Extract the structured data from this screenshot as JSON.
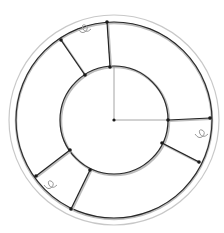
{
  "diagram": {
    "type": "circular-track-layout",
    "center": {
      "x": 114,
      "y": 120
    },
    "colors": {
      "background": "#ffffff",
      "outer_circle": "#c8c8c8",
      "track": "#2a2a2a",
      "track_shadow": "#bdbdbd",
      "spoke": "#222222",
      "node": "#1a1a1a",
      "axis": "#9a9a9a",
      "loop": "#9a9a9a"
    },
    "outer_circle": {
      "r": 105
    },
    "outer_track": {
      "r": 98
    },
    "inner_track": {
      "r": 54
    },
    "axes": [
      {
        "name": "vertical-axis",
        "x1": 114,
        "y1": 120,
        "x2": 114,
        "y2": 67
      },
      {
        "name": "horizontal-axis",
        "x1": 114,
        "y1": 120,
        "x2": 168,
        "y2": 120
      }
    ],
    "spokes": [
      {
        "name": "spoke-top",
        "x1": 107,
        "y1": 22,
        "x2": 110,
        "y2": 67
      },
      {
        "name": "spoke-upper-left",
        "x1": 61,
        "y1": 40,
        "x2": 85,
        "y2": 75
      },
      {
        "name": "spoke-right",
        "x1": 168,
        "y1": 120,
        "x2": 210,
        "y2": 118
      },
      {
        "name": "spoke-lower-right",
        "x1": 162,
        "y1": 143,
        "x2": 199,
        "y2": 162
      },
      {
        "name": "spoke-lower-left-a",
        "x1": 70,
        "y1": 150,
        "x2": 36,
        "y2": 176
      },
      {
        "name": "spoke-lower-left-b",
        "x1": 90,
        "y1": 170,
        "x2": 71,
        "y2": 209
      }
    ],
    "loops": [
      {
        "name": "loop-top",
        "cx": 86,
        "cy": 32
      },
      {
        "name": "loop-right",
        "cx": 203,
        "cy": 137
      },
      {
        "name": "loop-lower-left",
        "cx": 52,
        "cy": 188
      }
    ],
    "center_node": {
      "x": 114,
      "y": 120
    }
  }
}
